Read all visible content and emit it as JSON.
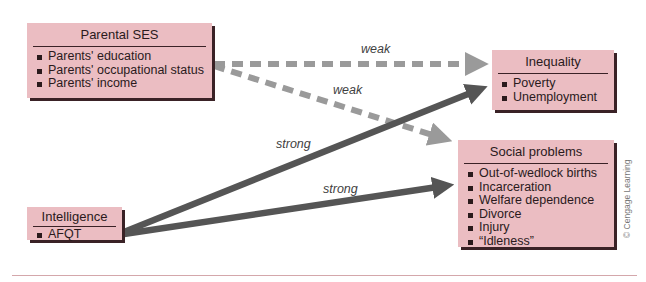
{
  "boxes": {
    "parental_ses": {
      "title": "Parental SES",
      "items": [
        "Parents' education",
        "Parents' occupational status",
        "Parents' income"
      ]
    },
    "inequality": {
      "title": "Inequality",
      "items": [
        "Poverty",
        "Unemployment"
      ]
    },
    "social_problems": {
      "title": "Social problems",
      "items": [
        "Out-of-wedlock births",
        "Incarceration",
        "Welfare dependence",
        "Divorce",
        "Injury",
        "“Idleness”"
      ]
    },
    "intelligence": {
      "title": "Intelligence",
      "items": [
        "AFQT"
      ]
    }
  },
  "arrows": {
    "ses_to_inequality": {
      "label": "weak",
      "style": "dashed"
    },
    "ses_to_social": {
      "label": "weak",
      "style": "dashed"
    },
    "intel_to_inequality": {
      "label": "strong",
      "style": "solid"
    },
    "intel_to_social": {
      "label": "strong",
      "style": "solid"
    }
  },
  "credit": "© Cengage Learning",
  "colors": {
    "box_fill": "#ebbdc2",
    "box_shadow": "#3a2226",
    "weak_arrow": "#9a9a9a",
    "strong_arrow": "#555555"
  }
}
